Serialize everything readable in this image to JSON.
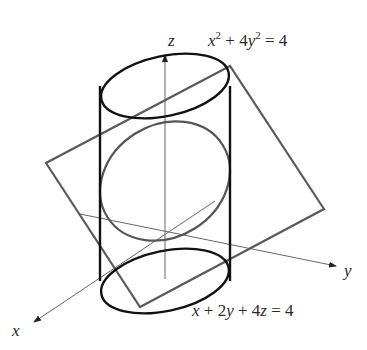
{
  "figure": {
    "labels": {
      "z_axis": "z",
      "y_axis": "y",
      "x_axis": "x"
    },
    "equations": {
      "cylinder": {
        "x_var": "x",
        "x_exp": "2",
        "plus": " + 4",
        "y_var": "y",
        "y_exp": "2",
        "rhs": " = 4"
      },
      "plane": {
        "t1": "x",
        "t2": " + 2",
        "t3": "y",
        "t4": " + 4",
        "t5": "z",
        "t6": " = 4"
      }
    },
    "colors": {
      "cylinder": "#111111",
      "plane": "#5a5a5a",
      "intersection": "#555555",
      "axes": "#666666"
    }
  }
}
